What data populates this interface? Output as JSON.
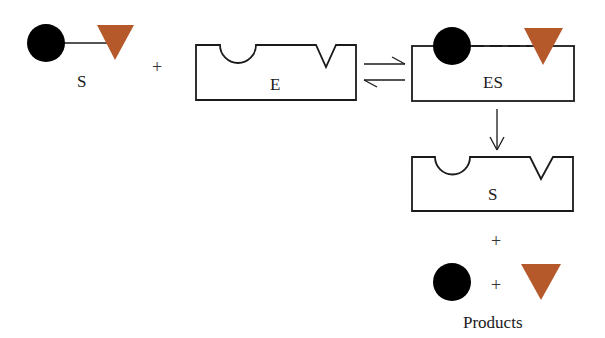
{
  "diagram": {
    "colors": {
      "circle": "#000000",
      "triangle": "#b5582a",
      "stroke": "#1a1a1a",
      "background": "#ffffff"
    },
    "nodes": {
      "substrate": {
        "label": "S",
        "shapes": [
          "black-circle",
          "orange-triangle"
        ],
        "bond": "solid"
      },
      "enzyme": {
        "label": "E"
      },
      "complex": {
        "label": "ES",
        "bond": "dashed"
      },
      "enzyme_after": {
        "label": "S"
      },
      "products": {
        "label": "Products"
      }
    },
    "operators": {
      "plus1": "+",
      "plus2": "+",
      "plus3": "+"
    },
    "arrows": [
      {
        "from": "enzyme",
        "to": "complex",
        "type": "equilibrium"
      },
      {
        "from": "complex",
        "to": "enzyme_after",
        "type": "forward"
      }
    ]
  }
}
